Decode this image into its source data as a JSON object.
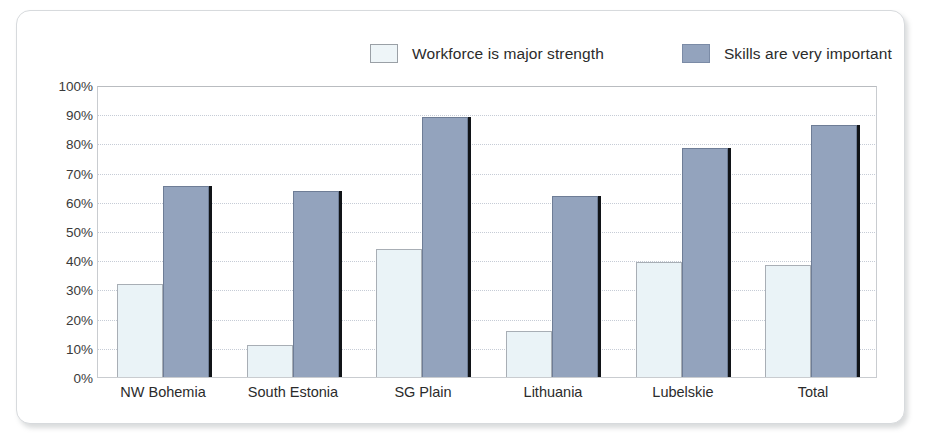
{
  "chart_data": {
    "type": "bar",
    "title": "",
    "xlabel": "",
    "ylabel": "",
    "ylim": [
      0,
      100
    ],
    "grid": true,
    "legend_position": "top",
    "categories": [
      "NW Bohemia",
      "South Estonia",
      "SG Plain",
      "Lithuania",
      "Lubelskie",
      "Total"
    ],
    "ytick_labels": [
      "100%",
      "90%",
      "80%",
      "70%",
      "60%",
      "50%",
      "40%",
      "30%",
      "20%",
      "10%",
      "0%"
    ],
    "ytick_values": [
      100,
      90,
      80,
      70,
      60,
      50,
      40,
      30,
      20,
      10,
      0
    ],
    "series": [
      {
        "name": "Workforce is major strength",
        "color": "#eaf3f7",
        "values": [
          32,
          11,
          44,
          16,
          39.5,
          38.5
        ]
      },
      {
        "name": "Skills are very important",
        "color": "#93a3bd",
        "values": [
          66,
          64,
          89.5,
          62.5,
          79,
          87
        ]
      }
    ]
  },
  "legend": {
    "items": [
      {
        "label": "Workforce is major strength",
        "swatch": "light"
      },
      {
        "label": "Skills are very important",
        "swatch": "dark"
      }
    ]
  }
}
